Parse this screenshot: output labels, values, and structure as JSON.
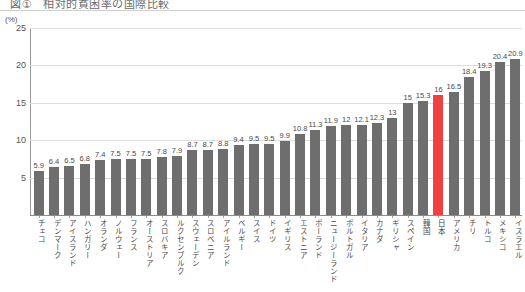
{
  "header": {
    "title_clipped": "図①　相対的貧困率の国際比較"
  },
  "chart_data": {
    "type": "bar",
    "title": "相対的貧困率の国際比較",
    "xlabel": "",
    "ylabel": "(%)",
    "yunit": "(%)",
    "ylim": [
      0,
      25
    ],
    "yticks": [
      25,
      20,
      15,
      10,
      5
    ],
    "grid": true,
    "legend": "none",
    "bar_color": "#6e6e6e",
    "highlight_color": "#f04040",
    "highlight_category": "日本",
    "categories": [
      "チェコ",
      "デンマーク",
      "アイスランド",
      "ハンガリー",
      "オランダ",
      "ノルウェー",
      "フランス",
      "オーストリア",
      "スロバキア",
      "ルクセンブルク",
      "スウェーデン",
      "スロベニア",
      "アイルランド",
      "ベルギー",
      "スイス",
      "ドイツ",
      "イギリス",
      "エストニア",
      "ポーランド",
      "ニュージーランド",
      "ポルトガル",
      "イタリア",
      "カナダ",
      "ギリシャ",
      "スペイン",
      "韓国",
      "日本",
      "アメリカ",
      "チリ",
      "トルコ",
      "メキシコ",
      "イスラエル"
    ],
    "values": [
      5.9,
      6.4,
      6.5,
      6.8,
      7.4,
      7.5,
      7.5,
      7.5,
      7.8,
      7.9,
      8.7,
      8.7,
      8.8,
      9.4,
      9.5,
      9.5,
      9.9,
      10.8,
      11.3,
      11.9,
      12,
      12.1,
      12.3,
      13,
      15,
      15.3,
      16,
      16.5,
      18.4,
      19.3,
      20.4,
      20.9
    ],
    "value_labels": [
      "5.9",
      "6.4",
      "6.5",
      "6.8",
      "7.4",
      "7.5",
      "7.5",
      "7.5",
      "7.8",
      "7.9",
      "8.7",
      "8.7",
      "8.8",
      "9.4",
      "9.5",
      "9.5",
      "9.9",
      "10.8",
      "11.3",
      "11.9",
      "12",
      "12.1",
      "12.3",
      "13",
      "15",
      "15.3",
      "16",
      "16.5",
      "18.4",
      "19.3",
      "20.4",
      "20.9"
    ]
  }
}
